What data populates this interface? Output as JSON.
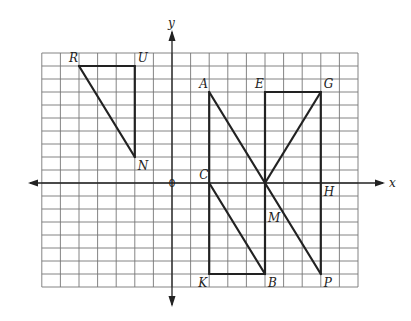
{
  "diagram": {
    "type": "coordinate-grid-figures",
    "axes": {
      "x_label": "x",
      "y_label": "y",
      "origin_label": "0"
    },
    "grid": {
      "x_range": [
        -7,
        10
      ],
      "y_range": [
        -8,
        10
      ]
    },
    "points": [
      {
        "name": "R",
        "x": -5,
        "y": 9,
        "label_pos": "nw"
      },
      {
        "name": "U",
        "x": -2,
        "y": 9,
        "label_pos": "ne"
      },
      {
        "name": "N",
        "x": -2,
        "y": 2,
        "label_pos": "se"
      },
      {
        "name": "A",
        "x": 2,
        "y": 7,
        "label_pos": "nw"
      },
      {
        "name": "E",
        "x": 5,
        "y": 7,
        "label_pos": "nw"
      },
      {
        "name": "G",
        "x": 8,
        "y": 7,
        "label_pos": "ne"
      },
      {
        "name": "C",
        "x": 2,
        "y": 0,
        "label_pos": "nw"
      },
      {
        "name": "H",
        "x": 8,
        "y": 0,
        "label_pos": "se"
      },
      {
        "name": "M",
        "x": 5,
        "y": -2,
        "label_pos": "se"
      },
      {
        "name": "K",
        "x": 2,
        "y": -7,
        "label_pos": "sw"
      },
      {
        "name": "B",
        "x": 5,
        "y": -7,
        "label_pos": "se"
      },
      {
        "name": "P",
        "x": 8,
        "y": -7,
        "label_pos": "se"
      }
    ],
    "segments": [
      [
        "R",
        "U"
      ],
      [
        "U",
        "N"
      ],
      [
        "R",
        "N"
      ],
      [
        "A",
        "K"
      ],
      [
        "K",
        "B"
      ],
      [
        "A",
        "P"
      ],
      [
        "C",
        "B"
      ],
      [
        "E",
        "G"
      ],
      [
        "E",
        "B"
      ],
      [
        "G",
        "P"
      ],
      [
        "G",
        "X"
      ]
    ],
    "extra_points": {
      "X": {
        "x": 5,
        "y": 0
      }
    }
  }
}
